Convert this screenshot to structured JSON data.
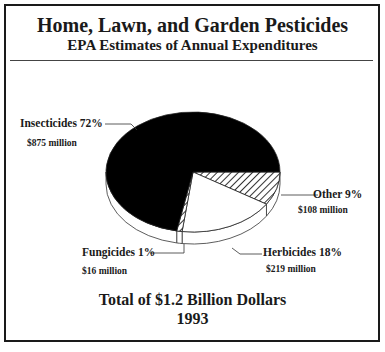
{
  "chart_data": {
    "type": "pie",
    "title": "Home, Lawn, and Garden Pesticides",
    "subtitle": "EPA Estimates of Annual Expenditures",
    "three_d": true,
    "slices": [
      {
        "name": "Other",
        "percent": 9,
        "amount": "$108 million",
        "label": "Other  9%",
        "fill": "hatch"
      },
      {
        "name": "Herbicides",
        "percent": 18,
        "amount": "$219 million",
        "label": "Herbicides  18%",
        "fill": "#ffffff"
      },
      {
        "name": "Fungicides",
        "percent": 1,
        "amount": "$16 million",
        "label": "Fungicides  1%",
        "fill": "hatch"
      },
      {
        "name": "Insecticides",
        "percent": 72,
        "amount": "$875 million",
        "label": "Insecticides  72%",
        "fill": "#000000"
      }
    ],
    "footer_total": "Total  of  $1.2  Billion Dollars",
    "footer_year": "1993"
  }
}
